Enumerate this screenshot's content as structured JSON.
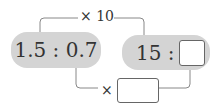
{
  "left_ratio": {
    "text": "1.5 : 0.7"
  },
  "right_ratio": {
    "text": "15 :"
  },
  "top_arrow": {
    "label": "× 10"
  },
  "bottom_arrow": {
    "label": "×"
  },
  "colors": {
    "pill": "#d4d4d4",
    "line": "#888888"
  }
}
